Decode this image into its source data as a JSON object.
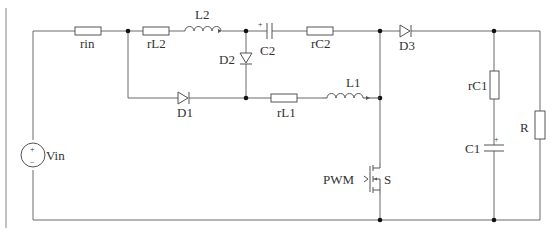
{
  "diagram": {
    "type": "circuit-schematic",
    "labels": {
      "rin": "rin",
      "rL2": "rL2",
      "L2": "L2",
      "C2": "C2",
      "rC2": "rC2",
      "D3": "D3",
      "D2": "D2",
      "D1": "D1",
      "rL1": "rL1",
      "L1": "L1",
      "rC1": "rC1",
      "C1": "C1",
      "R": "R",
      "Vin": "Vin",
      "PWM": "PWM",
      "S": "S"
    },
    "polarity": {
      "plus": "+",
      "minus": "−"
    },
    "components": [
      {
        "id": "Vin",
        "kind": "voltage-source"
      },
      {
        "id": "rin",
        "kind": "resistor"
      },
      {
        "id": "rL2",
        "kind": "resistor"
      },
      {
        "id": "L2",
        "kind": "inductor"
      },
      {
        "id": "C2",
        "kind": "polarized-capacitor"
      },
      {
        "id": "rC2",
        "kind": "resistor"
      },
      {
        "id": "D3",
        "kind": "diode"
      },
      {
        "id": "D2",
        "kind": "diode"
      },
      {
        "id": "D1",
        "kind": "diode"
      },
      {
        "id": "rL1",
        "kind": "resistor"
      },
      {
        "id": "L1",
        "kind": "inductor"
      },
      {
        "id": "S",
        "kind": "mosfet-switch"
      },
      {
        "id": "rC1",
        "kind": "resistor"
      },
      {
        "id": "C1",
        "kind": "polarized-capacitor"
      },
      {
        "id": "R",
        "kind": "load-resistor"
      }
    ]
  }
}
